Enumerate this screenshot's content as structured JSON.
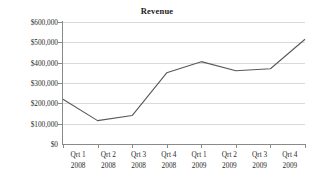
{
  "chart_data": {
    "type": "line",
    "title": "Revenue",
    "xlabel": "",
    "ylabel": "",
    "categories": [
      "Qrt 1 2008",
      "Qrt 2 2008",
      "Qrt 3 2008",
      "Qrt 4 2008",
      "Qrt 1 2009",
      "Qrt 2 2009",
      "Qrt 3 2009",
      "Qrt 4 2009"
    ],
    "category_parts": [
      {
        "quarter": "Qrt 1",
        "year": "2008"
      },
      {
        "quarter": "Qrt 2",
        "year": "2008"
      },
      {
        "quarter": "Qrt 3",
        "year": "2008"
      },
      {
        "quarter": "Qrt 4",
        "year": "2008"
      },
      {
        "quarter": "Qrt 1",
        "year": "2009"
      },
      {
        "quarter": "Qrt 2",
        "year": "2009"
      },
      {
        "quarter": "Qrt 3",
        "year": "2009"
      },
      {
        "quarter": "Qrt 4",
        "year": "2009"
      }
    ],
    "values": [
      220000,
      115000,
      140000,
      350000,
      405000,
      360000,
      370000,
      515000
    ],
    "ylim": [
      0,
      600000
    ],
    "ytick_values": [
      0,
      100000,
      200000,
      300000,
      400000,
      500000,
      600000
    ],
    "ytick_labels": [
      "$0",
      "$100,000",
      "$200,000",
      "$300,000",
      "$400,000",
      "$500,000",
      "$600,000"
    ],
    "grid": "horizontal",
    "legend": "none",
    "series": [
      {
        "name": "Revenue",
        "values": [
          220000,
          115000,
          140000,
          350000,
          405000,
          360000,
          370000,
          515000
        ]
      }
    ],
    "colors": {
      "line": "#595959",
      "gridline": "#d9d9d9",
      "axis": "#8a8a8a",
      "text": "#2b2b2b",
      "background": "#ffffff"
    }
  }
}
